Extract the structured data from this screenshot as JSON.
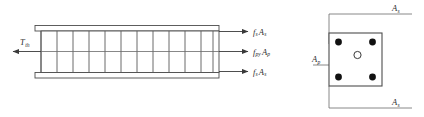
{
  "figure": {
    "type": "engineering-diagram",
    "background_color": "#ffffff",
    "line_color": "#4d4d4d",
    "text_color": "#2b2b2b"
  },
  "elevation": {
    "name": "beam-elevation",
    "stirrup_count": 11,
    "applied_force": {
      "symbol": "T",
      "subscript": "th",
      "direction": "left"
    },
    "resultant_forces": [
      {
        "symbol": "f",
        "sub1": "s",
        "symbol2": "A",
        "sub2": "s",
        "position": "top",
        "direction": "right"
      },
      {
        "symbol": "f",
        "sub1": "py",
        "symbol2": "A",
        "sub2": "p",
        "position": "middle",
        "direction": "right"
      },
      {
        "symbol": "f",
        "sub1": "s",
        "symbol2": "A",
        "sub2": "s",
        "position": "bottom",
        "direction": "right"
      }
    ]
  },
  "section": {
    "name": "beam-cross-section",
    "bar_count": 4,
    "tendon_count": 1,
    "labels": [
      {
        "symbol": "A",
        "subscript": "s",
        "position": "top-right"
      },
      {
        "symbol": "A",
        "subscript": "p",
        "position": "left"
      },
      {
        "symbol": "A",
        "subscript": "s",
        "position": "bottom-right"
      }
    ]
  }
}
